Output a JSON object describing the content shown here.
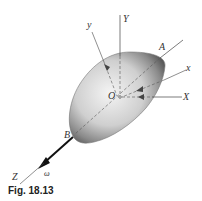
{
  "figure": {
    "caption": "Fig. 18.13",
    "labels": {
      "y_body": "y",
      "Y_fixed": "Y",
      "A": "A",
      "x_body": "x",
      "O": "O",
      "X_fixed": "X",
      "B": "B",
      "Z_fixed": "Z",
      "omega": "ω"
    },
    "colors": {
      "body_light": "#f2f2f2",
      "body_dark": "#5a5a5a",
      "line": "#444444",
      "vector": "#111111"
    }
  }
}
